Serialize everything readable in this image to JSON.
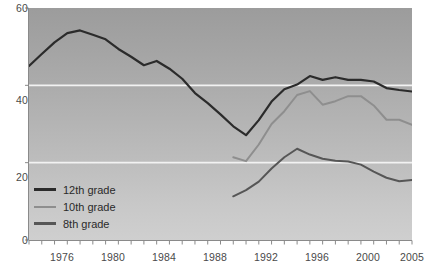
{
  "chart_data": {
    "type": "line",
    "title": "",
    "subtitle": "",
    "xlabel": "",
    "ylabel": "",
    "xlim": [
      1975,
      2005
    ],
    "ylim": [
      0,
      60
    ],
    "yticks": [
      0,
      20,
      40,
      60
    ],
    "xticks": [
      1975,
      1976,
      1977,
      1978,
      1979,
      1980,
      1981,
      1982,
      1983,
      1984,
      1985,
      1986,
      1987,
      1988,
      1989,
      1990,
      1991,
      1992,
      1993,
      1994,
      1995,
      1996,
      1997,
      1998,
      1999,
      2000,
      2001,
      2002,
      2003,
      2004,
      2005
    ],
    "xtick_labels": [
      "1976",
      "1980",
      "1984",
      "1988",
      "1992",
      "1996",
      "2000",
      "2005"
    ],
    "xtick_label_years": [
      1976,
      1980,
      1984,
      1988,
      1992,
      1996,
      2000,
      2005
    ],
    "grid": "horizontal-white-at-20-and-40",
    "legend_position": "lower-left-inside",
    "series": [
      {
        "name": "12th grade",
        "color": "#2b2b2b",
        "width": 2.2,
        "x": [
          1975,
          1976,
          1977,
          1978,
          1979,
          1980,
          1981,
          1982,
          1983,
          1984,
          1985,
          1986,
          1987,
          1988,
          1989,
          1990,
          1991,
          1992,
          1993,
          1994,
          1995,
          1996,
          1997,
          1998,
          1999,
          2000,
          2001,
          2002,
          2003,
          2004,
          2005
        ],
        "values": [
          45.0,
          48.1,
          51.1,
          53.5,
          54.2,
          53.1,
          51.9,
          49.4,
          47.4,
          45.2,
          46.3,
          44.3,
          41.7,
          38.0,
          35.4,
          32.5,
          29.4,
          27.1,
          31.0,
          35.8,
          39.0,
          40.2,
          42.4,
          41.4,
          42.1,
          41.4,
          41.4,
          41.0,
          39.3,
          38.8,
          38.4
        ]
      },
      {
        "name": "10th grade",
        "color": "#8e8e8e",
        "width": 2.0,
        "x": [
          1991,
          1992,
          1993,
          1994,
          1995,
          1996,
          1997,
          1998,
          1999,
          2000,
          2001,
          2002,
          2003,
          2004,
          2005
        ],
        "values": [
          21.4,
          20.4,
          24.7,
          30.0,
          33.3,
          37.5,
          38.5,
          35.0,
          35.9,
          37.2,
          37.2,
          34.8,
          31.1,
          31.1,
          29.8
        ]
      },
      {
        "name": "8th grade",
        "color": "#565656",
        "width": 2.0,
        "x": [
          1991,
          1992,
          1993,
          1994,
          1995,
          1996,
          1997,
          1998,
          1999,
          2000,
          2001,
          2002,
          2003,
          2004,
          2005
        ],
        "values": [
          11.3,
          12.9,
          15.1,
          18.5,
          21.4,
          23.6,
          22.1,
          21.0,
          20.5,
          20.3,
          19.5,
          17.7,
          16.1,
          15.2,
          15.5
        ]
      }
    ]
  },
  "axis": {
    "y_ticks": [
      {
        "label": "60",
        "value": 60
      },
      {
        "label": "40",
        "value": 40
      },
      {
        "label": "20",
        "value": 20
      },
      {
        "label": "0",
        "value": 0
      }
    ],
    "x_ticks": [
      {
        "label": "1976",
        "value": 1976
      },
      {
        "label": "1980",
        "value": 1980
      },
      {
        "label": "1984",
        "value": 1984
      },
      {
        "label": "1988",
        "value": 1988
      },
      {
        "label": "1992",
        "value": 1992
      },
      {
        "label": "1996",
        "value": 1996
      },
      {
        "label": "2000",
        "value": 2000
      },
      {
        "label": "2005",
        "value": 2005
      }
    ]
  },
  "legend": {
    "items": [
      {
        "label": "12th grade",
        "color": "#2b2b2b",
        "width": 2.6
      },
      {
        "label": "10th grade",
        "color": "#8e8e8e",
        "width": 2.0
      },
      {
        "label": "8th grade",
        "color": "#565656",
        "width": 2.4
      }
    ]
  },
  "colors": {
    "plot_bg_top": "#9c9c9c",
    "plot_bg_bottom": "#cfcfcf",
    "gridline": "#f2f2f2",
    "axis": "#8a8a8a",
    "tick_text": "#4a4a4a"
  }
}
